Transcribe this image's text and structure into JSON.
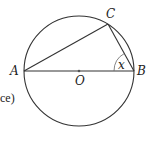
{
  "diagram": {
    "type": "circle-geometry",
    "circle": {
      "center": [
        79,
        71
      ],
      "radius": 55,
      "stroke": "#333333"
    },
    "points": {
      "A": {
        "label": "A",
        "x": 24,
        "y": 71
      },
      "B": {
        "label": "B",
        "x": 134,
        "y": 71
      },
      "C": {
        "label": "C",
        "x": 108,
        "y": 24
      },
      "O": {
        "label": "O",
        "x": 79,
        "y": 71
      }
    },
    "segments": [
      {
        "from": "A",
        "to": "B",
        "name": "diameter AB"
      },
      {
        "from": "A",
        "to": "C",
        "name": "chord AC"
      },
      {
        "from": "C",
        "to": "B",
        "name": "chord CB"
      }
    ],
    "angle": {
      "at": "B",
      "label": "x"
    },
    "fragment_text": "ce)"
  }
}
